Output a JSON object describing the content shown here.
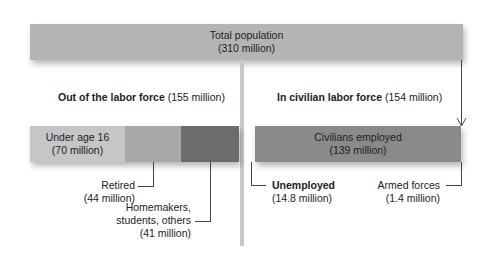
{
  "total": {
    "title": "Total population",
    "value": "(310 million)"
  },
  "left_group": {
    "title": "Out of the labor force",
    "value": "(155 million)"
  },
  "right_group": {
    "title": "In civilian labor force",
    "value": "(154 million)"
  },
  "segments": {
    "under16": {
      "title": "Under age 16",
      "value": "(70 million)"
    },
    "retired": {
      "title": "Retired",
      "value": "(44 million)"
    },
    "homemakers": {
      "line1": "Homemakers,",
      "line2": "students, others",
      "value": "(41 million)"
    },
    "employed": {
      "title": "Civilians employed",
      "value": "(139 million)"
    },
    "unemployed": {
      "title": "Unemployed",
      "value": "(14.8 million)"
    },
    "armed": {
      "title": "Armed forces",
      "value": "(1.4 million)"
    }
  },
  "colors": {
    "total": "#b4b4b4",
    "under16": "#c6c6c6",
    "retired": "#a8a8a8",
    "homemakers": "#6c6c6c",
    "employed": "#8a8a8a",
    "divider": "#c8c8c8"
  }
}
